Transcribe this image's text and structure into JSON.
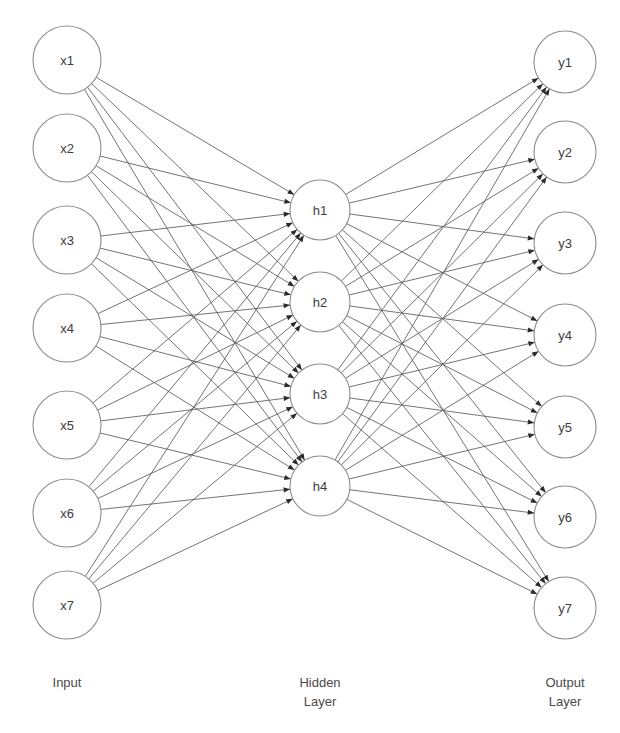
{
  "diagram": {
    "title_fragment": "",
    "background_color": "#ffffff",
    "edge_color": "#5b5b5b",
    "node_stroke_color": "#8c8c8c",
    "node_fill_color": "#ffffff",
    "label_color": "#3d3d3d",
    "caption_color": "#4a4a4a",
    "arrowhead_color": "#2b2b2b"
  },
  "layers": {
    "input": {
      "caption": "Input",
      "caption_lines": [
        "Input"
      ],
      "caption_x": 67,
      "caption_y": 687,
      "node_count": 7,
      "center_x": 67,
      "radius": 34,
      "nodes": [
        {
          "label": "x1",
          "cx": 67,
          "cy": 60
        },
        {
          "label": "x2",
          "cx": 67,
          "cy": 148
        },
        {
          "label": "x3",
          "cx": 67,
          "cy": 240
        },
        {
          "label": "x4",
          "cx": 67,
          "cy": 328
        },
        {
          "label": "x5",
          "cx": 67,
          "cy": 425
        },
        {
          "label": "x6",
          "cx": 67,
          "cy": 513
        },
        {
          "label": "x7",
          "cx": 67,
          "cy": 605
        }
      ]
    },
    "hidden": {
      "caption": "Hidden Layer",
      "caption_lines": [
        "Hidden",
        "Layer"
      ],
      "caption_x": 320,
      "caption_y": 687,
      "node_count": 4,
      "center_x": 320,
      "radius": 30,
      "nodes": [
        {
          "label": "h1",
          "cx": 320,
          "cy": 210
        },
        {
          "label": "h2",
          "cx": 320,
          "cy": 302
        },
        {
          "label": "h3",
          "cx": 320,
          "cy": 394
        },
        {
          "label": "h4",
          "cx": 320,
          "cy": 486
        }
      ]
    },
    "output": {
      "caption": "Output Layer",
      "caption_lines": [
        "Output",
        "Layer"
      ],
      "caption_x": 565,
      "caption_y": 687,
      "node_count": 7,
      "center_x": 565,
      "radius": 31,
      "nodes": [
        {
          "label": "y1",
          "cx": 565,
          "cy": 62
        },
        {
          "label": "y2",
          "cx": 565,
          "cy": 152
        },
        {
          "label": "y3",
          "cx": 565,
          "cy": 243
        },
        {
          "label": "y4",
          "cx": 565,
          "cy": 335
        },
        {
          "label": "y5",
          "cx": 565,
          "cy": 427
        },
        {
          "label": "y6",
          "cx": 565,
          "cy": 517
        },
        {
          "label": "y7",
          "cx": 565,
          "cy": 608
        }
      ]
    }
  },
  "connections": {
    "input_to_hidden": "fully-connected",
    "hidden_to_output": "fully-connected",
    "input_to_hidden_count": 28,
    "hidden_to_output_count": 28,
    "arrow_direction": "left-to-right"
  }
}
